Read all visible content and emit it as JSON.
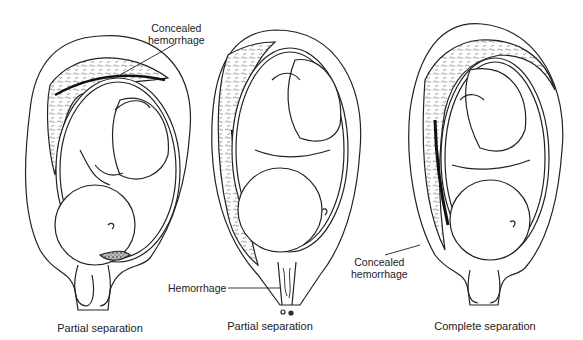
{
  "figure": {
    "panels": [
      {
        "id": "panel-1",
        "caption": "Partial separation",
        "label": {
          "line1": "Concealed",
          "line2": "hemorrhage"
        }
      },
      {
        "id": "panel-2",
        "caption": "Partial separation",
        "label": {
          "line1": "Hemorrhage"
        }
      },
      {
        "id": "panel-3",
        "caption": "Complete separation",
        "label": {
          "line1": "Concealed",
          "line2": "hemorrhage"
        }
      }
    ]
  }
}
